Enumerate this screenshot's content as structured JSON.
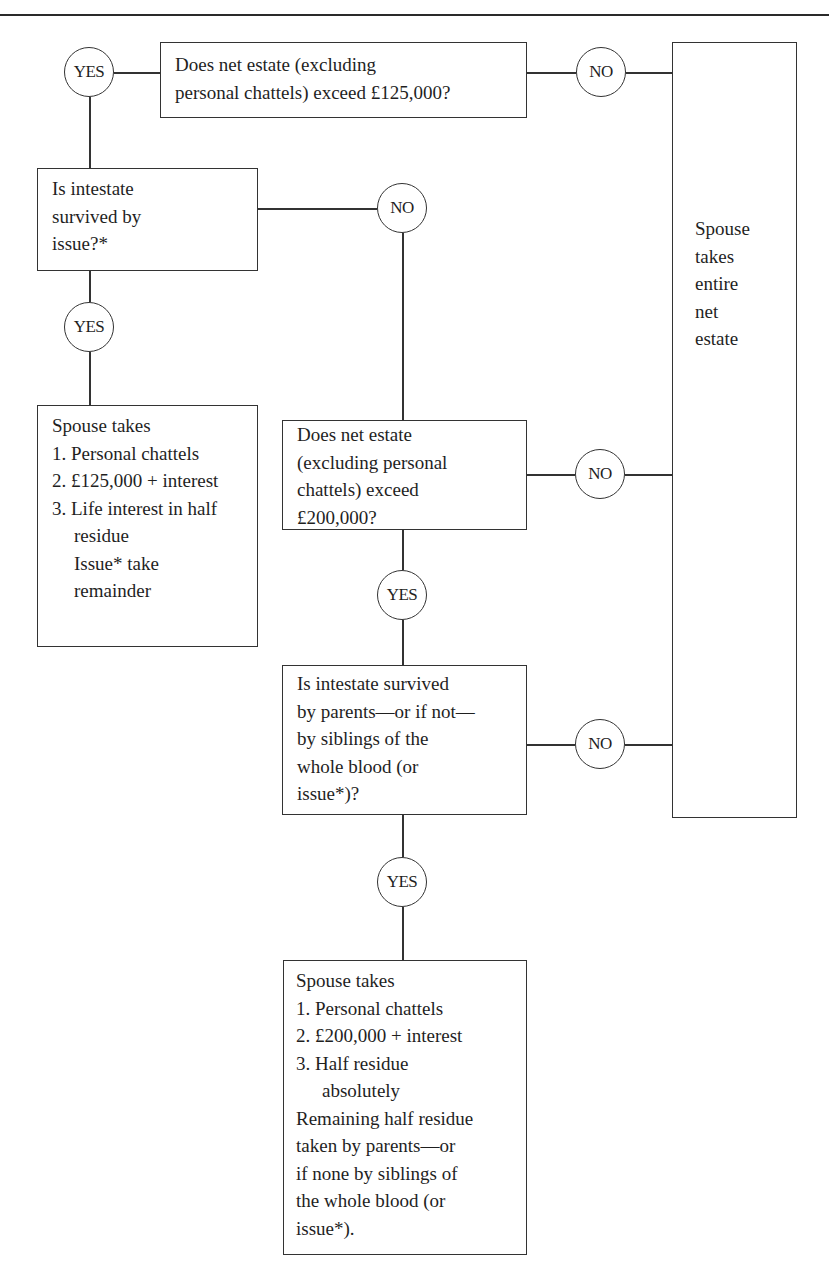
{
  "diagram": {
    "clipped_heading": "Intestacy: spouse survives — no will",
    "nodes": {
      "q_125k": {
        "lines": [
          "Does net estate (excluding",
          "personal chattels) exceed £125,000?"
        ]
      },
      "q_issue": {
        "lines": [
          "Is intestate",
          "survived by",
          "issue?*"
        ]
      },
      "q_200k": {
        "lines": [
          "Does net estate",
          "(excluding personal",
          "chattels) exceed",
          "£200,000?"
        ]
      },
      "q_parents": {
        "lines": [
          "Is intestate survived",
          "by parents—or if not—",
          "by siblings of the",
          "whole blood (or",
          "issue*)?"
        ]
      },
      "out_entire": {
        "lines": [
          "Spouse",
          "takes",
          "entire",
          "net",
          "estate"
        ]
      },
      "out_issue": {
        "heading": "Spouse takes",
        "items": [
          "1. Personal chattels",
          "2. £125,000 + interest",
          "3. Life interest in half residue"
        ],
        "footer": [
          "Issue* take",
          "remainder"
        ]
      },
      "out_parents": {
        "heading": "Spouse takes",
        "items": [
          "1. Personal chattels",
          "2. £200,000 + interest",
          "3. Half residue absolutely"
        ],
        "footer": [
          "Remaining half residue",
          "taken by parents—or",
          "if none by siblings of",
          "the whole blood (or",
          "issue*)."
        ]
      }
    },
    "labels": {
      "yes": "YES",
      "no": "NO"
    }
  }
}
